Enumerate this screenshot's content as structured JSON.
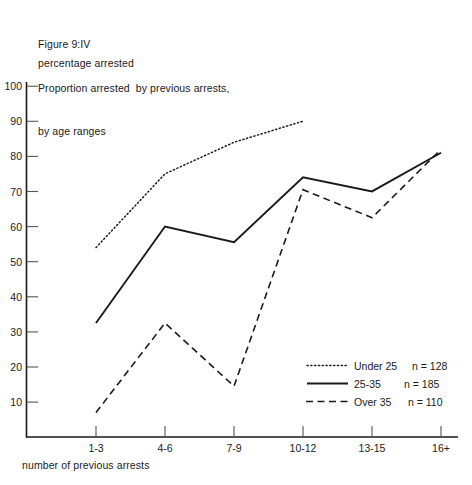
{
  "figure": {
    "number": "Figure 9:IV",
    "title_line1": "Proportion arrested  by previous arrests,",
    "title_line2": "by age ranges",
    "ylabel": "percentage arrested",
    "xlabel": "number of previous arrests"
  },
  "chart_data": {
    "type": "line",
    "title": "Proportion arrested by previous arrests, by age ranges",
    "xlabel": "number of previous arrests",
    "ylabel": "percentage arrested",
    "categories": [
      "1-3",
      "4-6",
      "7-9",
      "10-12",
      "13-15",
      "16+"
    ],
    "ylim": [
      0,
      100
    ],
    "yticks": [
      10,
      20,
      30,
      40,
      50,
      60,
      70,
      80,
      90,
      100
    ],
    "ytick_labels": [
      "10",
      "20",
      "30",
      "40",
      "50",
      "60",
      "70",
      "80",
      "90",
      "100"
    ],
    "grid": false,
    "legend_position": "bottom-right",
    "series": [
      {
        "name": "Under 25",
        "n": 128,
        "legend_label": "Under 25",
        "legend_n": "n = 128",
        "style": "dotted",
        "x_start_index": 0,
        "values": [
          54,
          75,
          84,
          90,
          null,
          null
        ]
      },
      {
        "name": "25-35",
        "n": 185,
        "legend_label": "25-35",
        "legend_n": "n = 185",
        "style": "solid",
        "x_start_index": 0,
        "values": [
          32.5,
          60,
          55.5,
          74,
          70,
          81
        ]
      },
      {
        "name": "Over 35",
        "n": 110,
        "legend_label": "Over 35",
        "legend_n": "n = 110",
        "style": "dashed",
        "x_start_index": 0,
        "values": [
          7,
          32.5,
          14.5,
          70.5,
          62.5,
          82
        ]
      }
    ]
  },
  "legend": {
    "rows": [
      {
        "label": "Under 25",
        "count": "n = 128"
      },
      {
        "label": "25-35",
        "count": "n = 185"
      },
      {
        "label": "Over 35",
        "count": "n = 110"
      }
    ]
  },
  "ytick_labels": [
    "100",
    "90",
    "80",
    "70",
    "60",
    "50",
    "40",
    "30",
    "20",
    "10"
  ],
  "xtick_labels": [
    "1-3",
    "4-6",
    "7-9",
    "10-12",
    "13-15",
    "16+"
  ]
}
